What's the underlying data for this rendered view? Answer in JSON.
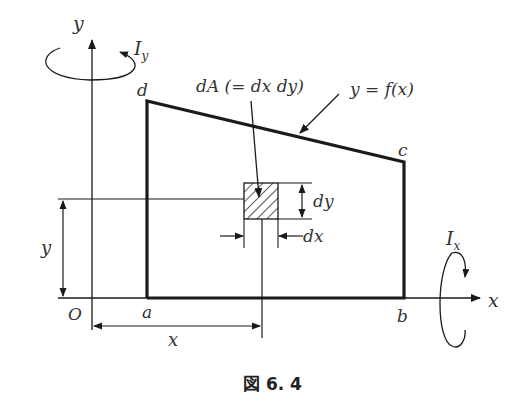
{
  "figure": {
    "caption": "図 6. 4",
    "axes": {
      "x_label": "x",
      "y_label": "y",
      "origin_label": "O"
    },
    "moments": {
      "Ix": {
        "symbol": "I",
        "subscript": "x"
      },
      "Iy": {
        "symbol": "I",
        "subscript": "y"
      }
    },
    "vertices": {
      "a": "a",
      "b": "b",
      "c": "c",
      "d": "d"
    },
    "labels": {
      "element_area": "dA (= dx dy)",
      "curve": "y = f(x)",
      "dy": "dy",
      "dx": "dx",
      "y_dimension": "y",
      "x_dimension": "x"
    },
    "colors": {
      "stroke": "#1a1a1a",
      "text": "#333333",
      "background": "#ffffff"
    }
  }
}
